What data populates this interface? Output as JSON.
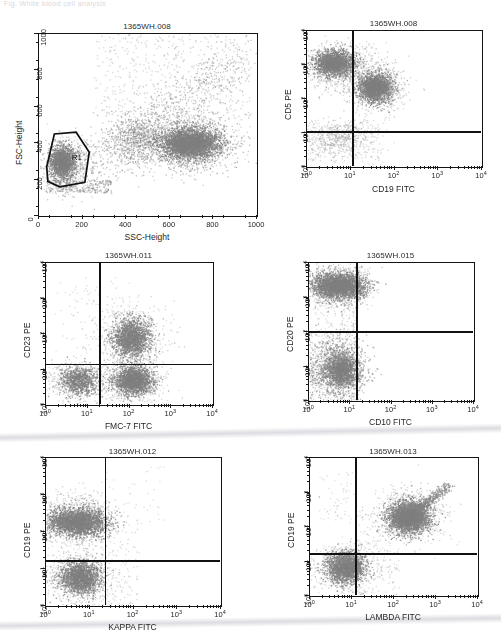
{
  "page": {
    "faint_header_text": "Fig.  White blood cell analysis",
    "dot_color": "#808080",
    "axis_color": "#131313",
    "background": "#ffffff"
  },
  "panels": [
    {
      "id": "p1",
      "name": "fsc-ssc-scatter",
      "title": "1365WH.008",
      "xlabel": "SSC-Height",
      "ylabel": "FSC-Height",
      "axis_type": "linear",
      "xticks": [
        "0",
        "200",
        "400",
        "600",
        "800",
        "1000"
      ],
      "yticks": [
        "0",
        "200",
        "400",
        "600",
        "800",
        "1000"
      ],
      "gate": {
        "label": "R1",
        "label_x": 0.155,
        "label_y": 0.66
      }
    },
    {
      "id": "p2",
      "name": "cd5-cd19-scatter",
      "title": "1365WH.008",
      "xlabel": "CD19 FITC",
      "ylabel": "CD5 PE",
      "axis_type": "log",
      "xticks": [
        "10",
        "10",
        "10",
        "10",
        "10"
      ],
      "xtick_exp": [
        "0",
        "1",
        "2",
        "3",
        "4"
      ],
      "yticks": [
        "10",
        "10",
        "10",
        "10",
        "10"
      ],
      "ytick_exp": [
        "0",
        "1",
        "2",
        "3",
        "4"
      ],
      "quadrant": {
        "vx": 0.265,
        "hy": 0.745
      }
    },
    {
      "id": "p3",
      "name": "cd23-fmc7-scatter",
      "title": "1365WH.011",
      "xlabel": "FMC-7 FITC",
      "ylabel": "CD23 PE",
      "axis_type": "log",
      "xticks": [
        "10",
        "10",
        "10",
        "10",
        "10"
      ],
      "xtick_exp": [
        "0",
        "1",
        "2",
        "3",
        "4"
      ],
      "yticks": [
        "10",
        "10",
        "10",
        "10",
        "10"
      ],
      "ytick_exp": [
        "0",
        "1",
        "2",
        "3",
        "4"
      ],
      "quadrant": {
        "vx": 0.325,
        "hy": 0.715
      }
    },
    {
      "id": "p4",
      "name": "cd20-cd10-scatter",
      "title": "1365WH.015",
      "xlabel": "CD10 FITC",
      "ylabel": "CD20 PE",
      "axis_type": "log",
      "xticks": [
        "10",
        "10",
        "10",
        "10",
        "10"
      ],
      "xtick_exp": [
        "0",
        "1",
        "2",
        "3",
        "4"
      ],
      "yticks": [
        "10",
        "10",
        "10",
        "10",
        "10"
      ],
      "ytick_exp": [
        "0",
        "1",
        "2",
        "3",
        "4"
      ],
      "quadrant": {
        "vx": 0.29,
        "hy": 0.5
      }
    },
    {
      "id": "p5",
      "name": "cd19-kappa-scatter",
      "title": "1365WH.012",
      "xlabel": "KAPPA FITC",
      "ylabel": "CD19 PE",
      "axis_type": "log",
      "xticks": [
        "10",
        "10",
        "10",
        "10",
        "10"
      ],
      "xtick_exp": [
        "0",
        "1",
        "2",
        "3",
        "4"
      ],
      "yticks": [
        "10",
        "10",
        "10",
        "10",
        "10"
      ],
      "ytick_exp": [
        "0",
        "1",
        "2",
        "3",
        "4"
      ],
      "quadrant": {
        "vx": 0.34,
        "hy": 0.695
      }
    },
    {
      "id": "p6",
      "name": "cd19-lambda-scatter",
      "title": "1365WH.013",
      "xlabel": "LAMBDA FITC",
      "ylabel": "CD19 PE",
      "axis_type": "log",
      "xticks": [
        "10",
        "10",
        "10",
        "10",
        "10"
      ],
      "xtick_exp": [
        "0",
        "1",
        "2",
        "3",
        "4"
      ],
      "yticks": [
        "10",
        "10",
        "10",
        "10",
        "10"
      ],
      "ytick_exp": [
        "0",
        "1",
        "2",
        "3",
        "4"
      ],
      "quadrant": {
        "vx": 0.275,
        "hy": 0.695
      }
    }
  ],
  "chart_data": {
    "type": "scatter",
    "note": "Six two-parameter flow cytometry dot plots. Plot 1 is linear FSC vs SSC with polygonal gate R1; plots 2-6 are 4-decade log/log fluorescence plots with quadrant markers.",
    "plots": [
      {
        "name": "1365WH.008 FSC/SSC",
        "x": "SSC-Height",
        "y": "FSC-Height",
        "xlim": [
          0,
          1000
        ],
        "ylim": [
          0,
          1000
        ],
        "scale": "linear",
        "gate": "R1",
        "clusters": [
          {
            "label": "lymphocytes (gated R1)",
            "cx": 110,
            "cy": 300,
            "sx": 45,
            "sy": 60,
            "n": 1400
          },
          {
            "label": "granulocytes",
            "cx": 690,
            "cy": 400,
            "sx": 115,
            "sy": 55,
            "n": 2600
          },
          {
            "label": "monocytes/intermediate",
            "cx": 420,
            "cy": 430,
            "sx": 110,
            "sy": 110,
            "n": 700
          },
          {
            "label": "debris/diagonal spread",
            "cx": 520,
            "cy": 620,
            "sx": 220,
            "sy": 180,
            "n": 600
          }
        ]
      },
      {
        "name": "1365WH.008 CD19/CD5",
        "x": "CD19 FITC",
        "y": "CD5 PE",
        "xlim": [
          1,
          10000
        ],
        "ylim": [
          1,
          10000
        ],
        "scale": "log",
        "quadrant_x": 14,
        "quadrant_y": 18,
        "clusters": [
          {
            "label": "CD5+ CD19- T cells",
            "cx": 4,
            "cy": 1200,
            "n": 1500
          },
          {
            "label": "CD5+ CD19+ B cells",
            "cx": 35,
            "cy": 220,
            "n": 1700
          },
          {
            "label": "CD5- CD19- background",
            "cx": 5,
            "cy": 7,
            "n": 450
          }
        ]
      },
      {
        "name": "1365WH.011 FMC-7/CD23",
        "x": "FMC-7 FITC",
        "y": "CD23 PE",
        "xlim": [
          1,
          10000
        ],
        "ylim": [
          1,
          10000
        ],
        "scale": "log",
        "quadrant_x": 20,
        "quadrant_y": 18,
        "clusters": [
          {
            "label": "CD23+ FMC-7+",
            "cx": 110,
            "cy": 90,
            "n": 1500
          },
          {
            "label": "CD23- FMC-7+",
            "cx": 120,
            "cy": 5,
            "n": 1600
          },
          {
            "label": "double negative",
            "cx": 6,
            "cy": 5,
            "n": 900
          }
        ]
      },
      {
        "name": "1365WH.015 CD10/CD20",
        "x": "CD10 FITC",
        "y": "CD20 PE",
        "xlim": [
          1,
          10000
        ],
        "ylim": [
          1,
          10000
        ],
        "scale": "log",
        "quadrant_x": 17,
        "quadrant_y": 100,
        "clusters": [
          {
            "label": "CD20 bright, CD10-",
            "cx": 5,
            "cy": 2100,
            "n": 2200
          },
          {
            "label": "CD20 dim, CD10-",
            "cx": 5,
            "cy": 9,
            "n": 2000
          }
        ]
      },
      {
        "name": "1365WH.012 KAPPA/CD19",
        "x": "KAPPA FITC",
        "y": "CD19 PE",
        "xlim": [
          1,
          10000
        ],
        "ylim": [
          1,
          10000
        ],
        "scale": "log",
        "quadrant_x": 22,
        "quadrant_y": 19,
        "clusters": [
          {
            "label": "CD19+ KAPPA-",
            "cx": 5,
            "cy": 190,
            "n": 2300
          },
          {
            "label": "CD19- KAPPA-",
            "cx": 6,
            "cy": 6,
            "n": 1600
          }
        ]
      },
      {
        "name": "1365WH.013 LAMBDA/CD19",
        "x": "LAMBDA FITC",
        "y": "CD19 PE",
        "xlim": [
          1,
          10000
        ],
        "ylim": [
          1,
          10000
        ],
        "scale": "log",
        "quadrant_x": 23,
        "quadrant_y": 19,
        "clusters": [
          {
            "label": "CD19+ LAMBDA+ (clonal)",
            "cx": 220,
            "cy": 200,
            "n": 2400
          },
          {
            "label": "CD19- LAMBDA-",
            "cx": 7,
            "cy": 7,
            "n": 1700
          }
        ]
      }
    ]
  }
}
